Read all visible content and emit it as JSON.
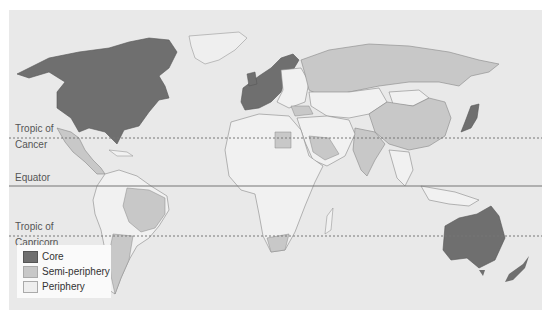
{
  "map": {
    "title": "World-systems: core, semi-periphery and periphery",
    "reference_lines": [
      {
        "label_line1": "Tropic of",
        "label_line2": "Cancer",
        "style": "dotted"
      },
      {
        "label_line1": "Equator",
        "label_line2": "",
        "style": "solid"
      },
      {
        "label_line1": "Tropic of",
        "label_line2": "Capricorn",
        "style": "dotted"
      }
    ],
    "legend": [
      {
        "label": "Core",
        "color": "#6f6f6f"
      },
      {
        "label": "Semi-periphery",
        "color": "#c8c8c8"
      },
      {
        "label": "Periphery",
        "color": "#eeeeee"
      }
    ],
    "colors": {
      "ocean": "#e9e9e9",
      "core": "#6f6f6f",
      "semi_periphery": "#c8c8c8",
      "periphery": "#f1f1f1",
      "border": "#8a8a8a"
    },
    "regions": {
      "core": [
        "Canada",
        "United States",
        "Western Europe",
        "Scandinavia",
        "Japan",
        "Australia",
        "New Zealand"
      ],
      "semi_periphery": [
        "Mexico",
        "Brazil",
        "Argentina",
        "Russia",
        "China",
        "India",
        "South Africa",
        "Saudi Arabia",
        "Egypt",
        "Turkey",
        "Iran"
      ],
      "periphery": [
        "Africa (most)",
        "Central Asia",
        "Mongolia",
        "Southeast Asia",
        "Central America",
        "Andean South America"
      ]
    }
  }
}
